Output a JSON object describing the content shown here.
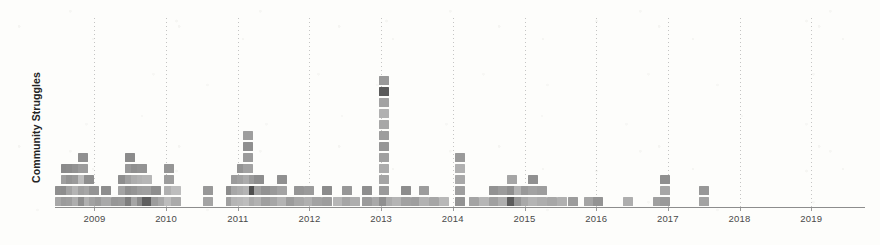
{
  "chart_data": {
    "type": "scatter",
    "title": "",
    "subtitle": "",
    "xlabel": "",
    "ylabel": "Community Struggles",
    "grid": true,
    "legend": false,
    "xlim": [
      2008.45,
      2019.75
    ],
    "ylim": [
      0,
      13
    ],
    "x_tick_labels": [
      "2009",
      "2010",
      "2011",
      "2012",
      "2013",
      "2014",
      "2015",
      "2016",
      "2017",
      "2018",
      "2019"
    ],
    "x_tick_values": [
      2009,
      2010,
      2011,
      2012,
      2013,
      2014,
      2015,
      2016,
      2017,
      2018,
      2019
    ],
    "y_tick_labels": [],
    "marker_shape": "square",
    "marker_size_px": 10,
    "colors": {
      "background": "#fdfdfb",
      "axis": "#8d8d8d",
      "gridline": "#969696",
      "tick_label": "#4a4a4a",
      "axis_label": "#232323",
      "marker_light": "#c9c9c9",
      "marker_mid": "#9d9d9d",
      "marker_dark": "#6f6f6f",
      "marker_darkest": "#4d4d4d"
    },
    "columns": [
      {
        "x": 2008.52,
        "counts": 2,
        "shades": [
          "#a7a7a7",
          "#8f8f8f"
        ]
      },
      {
        "x": 2008.6,
        "counts": 4,
        "shades": [
          "#9b9b9b",
          "#8d8d8d",
          "#9f9f9f",
          "#8a8a8a"
        ]
      },
      {
        "x": 2008.68,
        "counts": 4,
        "shades": [
          "#9e9e9e",
          "#a3a3a3",
          "#949494",
          "#8c8c8c"
        ]
      },
      {
        "x": 2008.76,
        "counts": 4,
        "shades": [
          "#aeaeae",
          "#b4b4b4",
          "#9a9a9a",
          "#929292"
        ]
      },
      {
        "x": 2008.84,
        "counts": 5,
        "shades": [
          "#8e8e8e",
          "#a0a0a0",
          "#bdbdbd",
          "#9c9c9c",
          "#909090"
        ]
      },
      {
        "x": 2008.92,
        "counts": 3,
        "shades": [
          "#b0b0b0",
          "#a6a6a6",
          "#8f8f8f"
        ]
      },
      {
        "x": 2009.0,
        "counts": 2,
        "shades": [
          "#a2a2a2",
          "#949494"
        ]
      },
      {
        "x": 2009.08,
        "counts": 1,
        "shades": [
          "#9b9b9b"
        ]
      },
      {
        "x": 2009.16,
        "counts": 2,
        "shades": [
          "#a9a9a9",
          "#8d8d8d"
        ]
      },
      {
        "x": 2009.3,
        "counts": 1,
        "shades": [
          "#979797"
        ]
      },
      {
        "x": 2009.4,
        "counts": 3,
        "shades": [
          "#9a9a9a",
          "#a4a4a4",
          "#8e8e8e"
        ]
      },
      {
        "x": 2009.5,
        "counts": 5,
        "shades": [
          "#7e7e7e",
          "#9090 90",
          "#a1a1a1",
          "#999999",
          "#8b8b8b"
        ]
      },
      {
        "x": 2009.58,
        "counts": 4,
        "shades": [
          "#a5a5a5",
          "#9595 95",
          "#adadad",
          "#8f8f8f"
        ]
      },
      {
        "x": 2009.66,
        "counts": 4,
        "shades": [
          "#8a8a8a",
          "#9e9e9e",
          "#b2b2b2",
          "#939393"
        ]
      },
      {
        "x": 2009.74,
        "counts": 3,
        "shades": [
          "#5f5f5f",
          "#a0a0a0",
          "#b6b6b6"
        ]
      },
      {
        "x": 2009.86,
        "counts": 2,
        "shades": [
          "#9c9c9c",
          "#8e8e8e"
        ]
      },
      {
        "x": 2009.96,
        "counts": 1,
        "shades": [
          "#a8a8a8"
        ]
      },
      {
        "x": 2010.04,
        "counts": 4,
        "shades": [
          "#bcbcbc",
          "#b0b0b0",
          "#9d9d9d",
          "#959595"
        ]
      },
      {
        "x": 2010.14,
        "counts": 2,
        "shades": [
          "#aaaaaa",
          "#bdbdbd"
        ]
      },
      {
        "x": 2010.58,
        "counts": 2,
        "shades": [
          "#a4a4a4",
          "#989898"
        ]
      },
      {
        "x": 2010.9,
        "counts": 2,
        "shades": [
          "#a0a0a0",
          "#8c8c8c"
        ]
      },
      {
        "x": 2010.98,
        "counts": 3,
        "shades": [
          "#b5b5b5",
          "#a7a7a7",
          "#9b9b9b"
        ]
      },
      {
        "x": 2011.06,
        "counts": 4,
        "shades": [
          "#b8b8b8",
          "#adadad",
          "#a1a1a1",
          "#949494"
        ]
      },
      {
        "x": 2011.14,
        "counts": 7,
        "shades": [
          "#bdbdbd",
          "#b4b4b4",
          "#ababab",
          "#a2a2a2",
          "#9b9b9b",
          "#8f8f8f",
          "#9e9e9e"
        ]
      },
      {
        "x": 2011.22,
        "counts": 3,
        "shades": [
          "#aaaaaa",
          "#4e4e4e",
          "#9a9a9a"
        ]
      },
      {
        "x": 2011.3,
        "counts": 3,
        "shades": [
          "#b2b2b2",
          "#a0a0a0",
          "#8d8d8d"
        ]
      },
      {
        "x": 2011.4,
        "counts": 2,
        "shades": [
          "#9f9f9f",
          "#929292"
        ]
      },
      {
        "x": 2011.52,
        "counts": 2,
        "shades": [
          "#a6a6a6",
          "#999999"
        ]
      },
      {
        "x": 2011.62,
        "counts": 3,
        "shades": [
          "#b4b4b4",
          "#a3a3a3",
          "#909090"
        ]
      },
      {
        "x": 2011.74,
        "counts": 1,
        "shades": [
          "#9c9c9c"
        ]
      },
      {
        "x": 2011.86,
        "counts": 2,
        "shades": [
          "#a8a8a8",
          "#959595"
        ]
      },
      {
        "x": 2012.0,
        "counts": 2,
        "shades": [
          "#b0b0b0",
          "#9a9a9a"
        ]
      },
      {
        "x": 2012.1,
        "counts": 1,
        "shades": [
          "#a2a2a2"
        ]
      },
      {
        "x": 2012.24,
        "counts": 2,
        "shades": [
          "#9d9d9d",
          "#8b8b8b"
        ]
      },
      {
        "x": 2012.4,
        "counts": 1,
        "shades": [
          "#b6b6b6"
        ]
      },
      {
        "x": 2012.52,
        "counts": 2,
        "shades": [
          "#a5a5a5",
          "#979797"
        ]
      },
      {
        "x": 2012.64,
        "counts": 1,
        "shades": [
          "#aeaeae"
        ]
      },
      {
        "x": 2012.8,
        "counts": 2,
        "shades": [
          "#9b9b9b",
          "#8e8e8e"
        ]
      },
      {
        "x": 2012.94,
        "counts": 1,
        "shades": [
          "#a9a9a9"
        ]
      },
      {
        "x": 2013.04,
        "counts": 12,
        "shades": [
          "#8f8f8f",
          "#9a9a9a",
          "#a4a4a4",
          "#ababab",
          "#a0a0a0",
          "#969696",
          "#9d9d9d",
          "#a7a7a7",
          "#b1b1b1",
          "#a3a3a3",
          "#5a5a5a",
          "#999999"
        ]
      },
      {
        "x": 2013.14,
        "counts": 1,
        "shades": [
          "#aaaaaa"
        ]
      },
      {
        "x": 2013.22,
        "counts": 1,
        "shades": [
          "#b4b4b4"
        ]
      },
      {
        "x": 2013.34,
        "counts": 2,
        "shades": [
          "#a1a1a1",
          "#8d8d8d"
        ]
      },
      {
        "x": 2013.48,
        "counts": 1,
        "shades": [
          "#9e9e9e"
        ]
      },
      {
        "x": 2013.6,
        "counts": 2,
        "shades": [
          "#b2b2b2",
          "#9c9c9c"
        ]
      },
      {
        "x": 2013.74,
        "counts": 1,
        "shades": [
          "#a6a6a6"
        ]
      },
      {
        "x": 2013.88,
        "counts": 1,
        "shades": [
          "#b8b8b8"
        ]
      },
      {
        "x": 2014.1,
        "counts": 5,
        "shades": [
          "#939393",
          "#9e9e9e",
          "#a8a8a8",
          "#b0b0b0",
          "#9a9a9a"
        ]
      },
      {
        "x": 2014.3,
        "counts": 1,
        "shades": [
          "#a4a4a4"
        ]
      },
      {
        "x": 2014.44,
        "counts": 1,
        "shades": [
          "#b6b6b6"
        ]
      },
      {
        "x": 2014.58,
        "counts": 2,
        "shades": [
          "#a0a0a0",
          "#929292"
        ]
      },
      {
        "x": 2014.7,
        "counts": 2,
        "shades": [
          "#aeaeae",
          "#9b9b9b"
        ]
      },
      {
        "x": 2014.82,
        "counts": 3,
        "shades": [
          "#5c5c5c",
          "#8e8e8e",
          "#a5a5a5"
        ]
      },
      {
        "x": 2014.92,
        "counts": 2,
        "shades": [
          "#9696 96",
          "#b2b2b2"
        ]
      },
      {
        "x": 2015.02,
        "counts": 2,
        "shades": [
          "#a9a9a9",
          "#999999"
        ]
      },
      {
        "x": 2015.12,
        "counts": 3,
        "shades": [
          "#b4b4b4",
          "#a2a2a2",
          "#909090"
        ]
      },
      {
        "x": 2015.24,
        "counts": 2,
        "shades": [
          "#adadad",
          "#9d9d9d"
        ]
      },
      {
        "x": 2015.38,
        "counts": 1,
        "shades": [
          "#a7a7a7"
        ]
      },
      {
        "x": 2015.52,
        "counts": 1,
        "shades": [
          "#b0b0b0"
        ]
      },
      {
        "x": 2015.68,
        "counts": 1,
        "shades": [
          "#9c9c9c"
        ]
      },
      {
        "x": 2015.9,
        "counts": 1,
        "shades": [
          "#a5a5a5"
        ]
      },
      {
        "x": 2016.02,
        "counts": 1,
        "shades": [
          "#949494"
        ]
      },
      {
        "x": 2016.44,
        "counts": 1,
        "shades": [
          "#aeaeae"
        ]
      },
      {
        "x": 2016.86,
        "counts": 1,
        "shades": [
          "#a0a0a0"
        ]
      },
      {
        "x": 2016.96,
        "counts": 3,
        "shades": [
          "#9a9a9a",
          "#a6a6a6",
          "#8f8f8f"
        ]
      },
      {
        "x": 2017.5,
        "counts": 2,
        "shades": [
          "#a3a3a3",
          "#979797"
        ]
      }
    ]
  }
}
